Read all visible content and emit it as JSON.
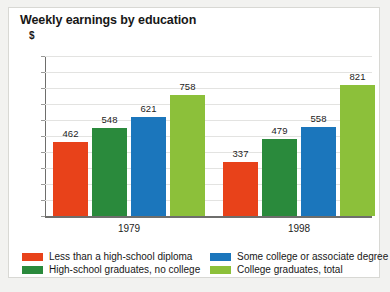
{
  "chart_data": {
    "type": "bar",
    "title": "Weekly earnings by education",
    "subtitle": "$",
    "xlabel": "",
    "ylabel": "$",
    "categories": [
      "1979",
      "1998"
    ],
    "ylim": [
      0,
      1000
    ],
    "ytick_labels": [
      "1000",
      "900",
      "800",
      "700",
      "600",
      "500",
      "400",
      "300",
      "200",
      "100",
      "0"
    ],
    "ytick_values": [
      1000,
      900,
      800,
      700,
      600,
      500,
      400,
      300,
      200,
      100,
      0
    ],
    "grid": true,
    "legend_position": "bottom",
    "series": [
      {
        "name": "Less than a high-school diploma",
        "color": "#e8421a",
        "values": [
          462,
          337
        ]
      },
      {
        "name": "High-school graduates, no college",
        "color": "#2a8a3c",
        "values": [
          548,
          479
        ]
      },
      {
        "name": "Some college or associate degree",
        "color": "#1b76bc",
        "values": [
          621,
          558
        ]
      },
      {
        "name": "College graduates, total",
        "color": "#8cc03a",
        "values": [
          758,
          821
        ]
      }
    ],
    "data_labels": [
      [
        "462",
        "548",
        "621",
        "758"
      ],
      [
        "337",
        "479",
        "558",
        "821"
      ]
    ]
  }
}
